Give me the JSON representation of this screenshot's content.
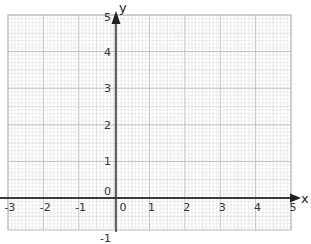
{
  "chart_data": {
    "type": "scatter",
    "title": "",
    "xlabel": "x",
    "ylabel": "y",
    "xlim": [
      -3,
      5
    ],
    "ylim": [
      -1,
      5
    ],
    "grid": true,
    "grid_style": "graph paper (major every 1 unit, minor every 0.1 unit)",
    "x_ticks": [
      "-3",
      "-2",
      "-1",
      "0",
      "1",
      "2",
      "3",
      "4",
      "5"
    ],
    "y_ticks": [
      "-1",
      "0",
      "1",
      "2",
      "3",
      "4",
      "5"
    ],
    "series": []
  },
  "axes": {
    "x_name": "x",
    "y_name": "y",
    "origin_label_x": "0",
    "origin_label_y": "0"
  },
  "colors": {
    "minor_grid": "#e2e2e2",
    "mid_grid": "#cfcfcf",
    "major_grid": "#bdbdbd",
    "axis": "#333333",
    "label": "#333333"
  }
}
